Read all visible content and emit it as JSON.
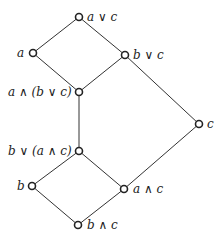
{
  "diagram": {
    "type": "hasse-diagram",
    "nodes": [
      {
        "id": "avc",
        "label": "a ∨ c",
        "x": 79,
        "y": 17,
        "label_side": "right"
      },
      {
        "id": "a",
        "label": "a",
        "x": 33,
        "y": 53,
        "label_side": "left"
      },
      {
        "id": "bvc",
        "label": "b ∨ c",
        "x": 125,
        "y": 55,
        "label_side": "right"
      },
      {
        "id": "a_and_bvc",
        "label": "a ∧ (b ∨ c)",
        "x": 79,
        "y": 92,
        "label_side": "left"
      },
      {
        "id": "c",
        "label": "c",
        "x": 199,
        "y": 124,
        "label_side": "right"
      },
      {
        "id": "b_or_aac",
        "label": "b ∨ (a ∧ c)",
        "x": 79,
        "y": 151,
        "label_side": "left"
      },
      {
        "id": "b",
        "label": "b",
        "x": 32,
        "y": 186,
        "label_side": "left"
      },
      {
        "id": "aac",
        "label": "a ∧ c",
        "x": 124,
        "y": 189,
        "label_side": "right"
      },
      {
        "id": "bac",
        "label": "b ∧ c",
        "x": 78,
        "y": 225,
        "label_side": "right"
      }
    ],
    "edges": [
      [
        "avc",
        "a"
      ],
      [
        "avc",
        "bvc"
      ],
      [
        "a",
        "a_and_bvc"
      ],
      [
        "bvc",
        "a_and_bvc"
      ],
      [
        "bvc",
        "c"
      ],
      [
        "a_and_bvc",
        "b_or_aac"
      ],
      [
        "b_or_aac",
        "b"
      ],
      [
        "b_or_aac",
        "aac"
      ],
      [
        "c",
        "aac"
      ],
      [
        "b",
        "bac"
      ],
      [
        "aac",
        "bac"
      ]
    ],
    "colors": {
      "line": "#333333",
      "node_fill": "#ffffff",
      "node_stroke": "#222222"
    }
  }
}
